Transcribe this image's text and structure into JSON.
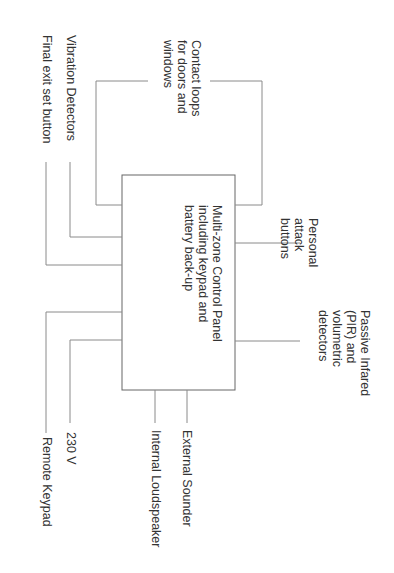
{
  "diagram": {
    "control_panel": {
      "label": "Multi-zone Control Panel\nincluding keypad and\nbattery back-up"
    },
    "left_inputs": [
      {
        "id": "contact-loops",
        "label": "Contact loops\nfor doors and\nwindows"
      },
      {
        "id": "vibration-detectors",
        "label": "Vibration Detectors"
      },
      {
        "id": "final-exit-set-button",
        "label": "Final exit set button"
      },
      {
        "id": "remote-keypad",
        "label": "Remote Keypad"
      },
      {
        "id": "power-230v",
        "label": "230 V"
      }
    ],
    "right_inputs": [
      {
        "id": "personal-attack-buttons",
        "label": "Personal\nattack\nbuttons"
      },
      {
        "id": "pir-detectors",
        "label": "Passive Infared\n(PIR) and\nvolumetric\ndetectors"
      }
    ],
    "outputs": [
      {
        "id": "internal-loudspeaker",
        "label": "Internal Loudspeaker"
      },
      {
        "id": "external-sounder",
        "label": "External Sounder"
      }
    ],
    "colors": {
      "line": "#8a8a8a",
      "box": "#666666",
      "text": "#333333"
    }
  }
}
